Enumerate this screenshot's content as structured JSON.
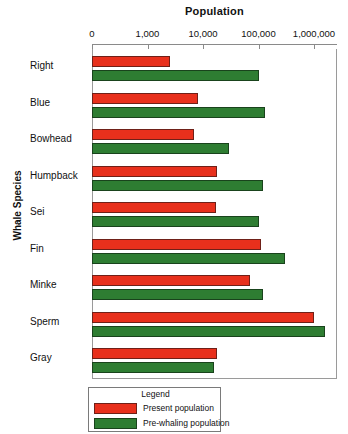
{
  "chart_data": {
    "type": "bar",
    "orientation": "horizontal",
    "title": "Population",
    "xlabel": "Population",
    "ylabel": "Whale Species",
    "xscale": "log",
    "xlim": [
      0,
      3000000
    ],
    "xticks": [
      0,
      1000,
      10000,
      100000,
      1000000
    ],
    "xticklabels": [
      "0",
      "1,000",
      "10,000",
      "100,000",
      "1,000,000"
    ],
    "grid": false,
    "legend": {
      "title": "Legend",
      "position": "bottom-left-outside",
      "entries": [
        "Present population",
        "Pre-whaling population"
      ]
    },
    "categories": [
      "Right",
      "Blue",
      "Bowhead",
      "Humpback",
      "Sei",
      "Fin",
      "Minke",
      "Sperm",
      "Gray"
    ],
    "series": [
      {
        "name": "Present population",
        "color": "#E8301C",
        "values": [
          2500,
          8000,
          7000,
          18000,
          17000,
          110000,
          70000,
          1000000,
          18000
        ]
      },
      {
        "name": "Pre-whaling population",
        "color": "#2E7D32",
        "values": [
          100000,
          130000,
          30000,
          120000,
          100000,
          300000,
          120000,
          1600000,
          16000
        ]
      }
    ]
  },
  "colors": {
    "present": "#E8301C",
    "prewhaling": "#2E7D32",
    "axis": "#8a8a8a",
    "frame": "#9a9a9a",
    "text": "#111111",
    "background": "#ffffff"
  }
}
